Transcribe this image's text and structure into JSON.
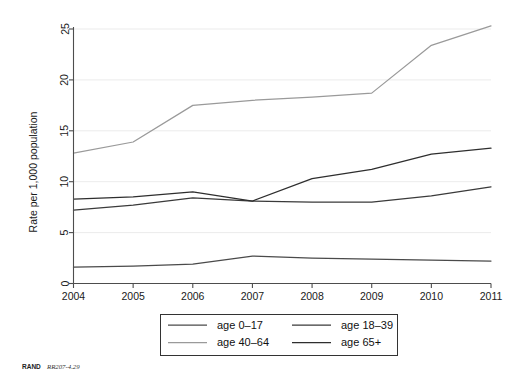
{
  "chart_data": {
    "type": "line",
    "title": "",
    "subtitle": "",
    "xlabel": "",
    "ylabel": "Rate per 1,000 population",
    "x": [
      2004,
      2005,
      2006,
      2007,
      2008,
      2009,
      2010,
      2011
    ],
    "categories": [
      "2004",
      "2005",
      "2006",
      "2007",
      "2008",
      "2009",
      "2010",
      "2011"
    ],
    "xlim": [
      2004,
      2011
    ],
    "ylim": [
      0,
      26
    ],
    "yticks": [
      0,
      5,
      10,
      15,
      20,
      25
    ],
    "ytick_labels": [
      "0",
      "5",
      "10",
      "15",
      "20",
      "25"
    ],
    "xtick_labels": [
      "2004",
      "2005",
      "2006",
      "2007",
      "2008",
      "2009",
      "2010",
      "2011"
    ],
    "grid": "horizontal",
    "legend_position": "bottom-center",
    "series": [
      {
        "name": "age 0–17",
        "color": "#4a4a4a",
        "values": [
          1.6,
          1.7,
          1.9,
          2.7,
          2.5,
          2.4,
          2.3,
          2.2
        ]
      },
      {
        "name": "age 18–39",
        "color": "#3a3a3a",
        "values": [
          7.2,
          7.7,
          8.4,
          8.1,
          8.0,
          8.0,
          8.6,
          9.5
        ]
      },
      {
        "name": "age 40–64",
        "color": "#9a9a9a",
        "values": [
          12.8,
          13.9,
          17.5,
          18.0,
          18.3,
          18.7,
          23.4,
          25.3
        ]
      },
      {
        "name": "age 65+",
        "color": "#2e2e2e",
        "values": [
          8.3,
          8.5,
          9.0,
          8.1,
          10.3,
          11.2,
          12.7,
          13.3
        ]
      }
    ]
  },
  "legend": {
    "entries": [
      {
        "label": "age 0–17"
      },
      {
        "label": "age 18–39"
      },
      {
        "label": "age 40–64"
      },
      {
        "label": "age 65+"
      }
    ]
  },
  "caption": {
    "source": "RAND",
    "figure_id": "RR207-4.29"
  },
  "colors": {
    "background": "#ffffff",
    "axis": "#4d4d4d",
    "grid": "#e6e6e6",
    "text": "#1a1a1a"
  }
}
